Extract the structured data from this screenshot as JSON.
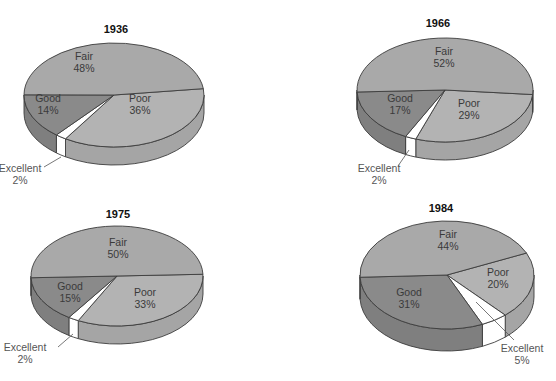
{
  "chart_data": [
    {
      "type": "pie",
      "title": "1936",
      "slices": [
        {
          "label": "Fair",
          "value": 48,
          "display": "48%"
        },
        {
          "label": "Poor",
          "value": 36,
          "display": "36%"
        },
        {
          "label": "Excellent",
          "value": 2,
          "display": "2%"
        },
        {
          "label": "Good",
          "value": 14,
          "display": "14%"
        }
      ]
    },
    {
      "type": "pie",
      "title": "1966",
      "slices": [
        {
          "label": "Fair",
          "value": 52,
          "display": "52%"
        },
        {
          "label": "Poor",
          "value": 29,
          "display": "29%"
        },
        {
          "label": "Excellent",
          "value": 2,
          "display": "2%"
        },
        {
          "label": "Good",
          "value": 17,
          "display": "17%"
        }
      ]
    },
    {
      "type": "pie",
      "title": "1975",
      "slices": [
        {
          "label": "Fair",
          "value": 50,
          "display": "50%"
        },
        {
          "label": "Poor",
          "value": 33,
          "display": "33%"
        },
        {
          "label": "Excellent",
          "value": 2,
          "display": "2%"
        },
        {
          "label": "Good",
          "value": 15,
          "display": "15%"
        }
      ]
    },
    {
      "type": "pie",
      "title": "1984",
      "slices": [
        {
          "label": "Fair",
          "value": 44,
          "display": "44%"
        },
        {
          "label": "Poor",
          "value": 20,
          "display": "20%"
        },
        {
          "label": "Excellent",
          "value": 5,
          "display": "5%"
        },
        {
          "label": "Good",
          "value": 31,
          "display": "31%"
        }
      ]
    }
  ],
  "colors": {
    "Fair": "#a9a9a9",
    "Poor": "#b3b3b3",
    "Excellent": "#ffffff",
    "Good": "#8a8a8a",
    "outline": "#3c3c3c"
  }
}
